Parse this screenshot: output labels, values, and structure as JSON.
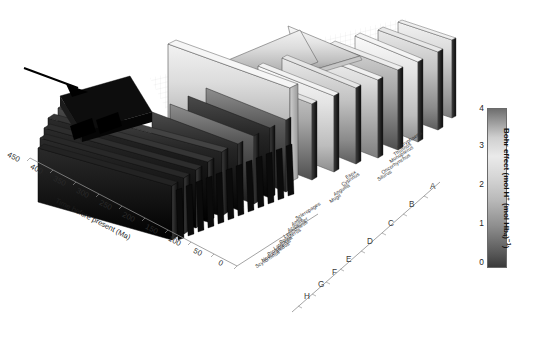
{
  "figure": {
    "type": "3d-surface-phylogeny"
  },
  "time_axis": {
    "label": "Time before present (Ma)",
    "ticks": [
      "450",
      "400",
      "350",
      "300",
      "250",
      "200",
      "150",
      "100",
      "50",
      "0"
    ],
    "values": [
      450,
      400,
      350,
      300,
      250,
      200,
      150,
      100,
      50,
      0
    ]
  },
  "colorbar": {
    "title_main": "Bohr effect",
    "title_units_pre": "(mol H",
    "title_units_sup": "+",
    "title_units_mid": " (mol Hb",
    "title_units_sub": "4",
    "title_units_post": ")",
    "title_units_exp": "−1",
    "title_units_close": ")",
    "ticks": [
      "4",
      "3",
      "2",
      "1",
      "0"
    ],
    "values": [
      4,
      3,
      2,
      1,
      0
    ],
    "min": 0,
    "max": 4,
    "color_low": "#3a3a3a",
    "color_mid": "#eaeaea",
    "color_high": "#6e6e6e"
  },
  "species": [
    "Coryphaena",
    "Thunnus",
    "Monopterus",
    "Oncorhynchus",
    "Silurus",
    "Esox",
    "Cyprinus",
    "Anguilla",
    "Mugil",
    "Scleropages",
    "Amia",
    "Acipenser",
    "Lepisosteus",
    "Polypterus",
    "Latimeria",
    "Protopterus",
    "Neoceratodus",
    "Scyliorhinus"
  ],
  "clades": [
    "A",
    "B",
    "C",
    "D",
    "E",
    "F",
    "G",
    "H"
  ],
  "annotation": {
    "arrow_name": "highlight-arrow",
    "arrow_target": "low Bohr effect ancestral ridge"
  }
}
